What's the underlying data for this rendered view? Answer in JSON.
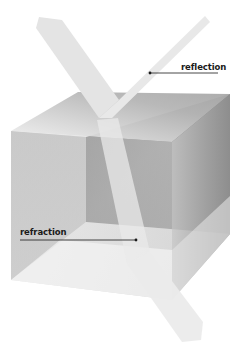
{
  "figure": {
    "labels": {
      "reflection": "reflection",
      "refraction": "refraction"
    },
    "annotations": [
      {
        "label": "reflection",
        "text_position": [
          181,
          63
        ],
        "leader_from": [
          218,
          73
        ],
        "leader_to": [
          150,
          73
        ]
      },
      {
        "label": "refraction",
        "text_position": [
          20,
          228
        ],
        "leader_from": [
          20,
          240
        ],
        "leader_to": [
          136,
          240
        ]
      }
    ],
    "elements": {
      "cube": "transparent-gray-cube",
      "incident_beam": "incident-light-beam",
      "reflected_beam": "reflected-light-beam",
      "refracted_beam": "refracted-light-beam",
      "exiting_beam": "exiting-light-beam"
    },
    "colors": {
      "background": "#ffffff",
      "beam": "#e6e6e6",
      "cube_top": "#b8b8b8",
      "cube_front": "#c4c4c4",
      "cube_right": "#9a9a9a",
      "cube_inner_back": "#7c7c7c",
      "cube_bottom": "#dedede",
      "leader_line": "#1a1a1a",
      "label_text": "#1a1a1a"
    }
  }
}
